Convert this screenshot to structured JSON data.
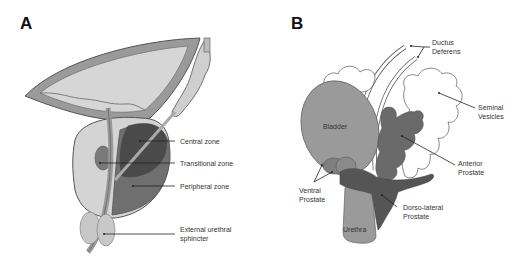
{
  "panel_a": {
    "letter": "A",
    "labels": {
      "central_zone": "Central zone",
      "transitional_zone": "Transitional zone",
      "peripheral_zone": "Peripheral zone",
      "external_sphincter_line1": "External urethral",
      "external_sphincter_line2": "sphincter"
    }
  },
  "panel_b": {
    "letter": "B",
    "labels": {
      "ductus_line1": "Ductus",
      "ductus_line2": "Deferens",
      "seminal_line1": "Seminal",
      "seminal_line2": "Vesicles",
      "bladder": "Bladder",
      "anterior_line1": "Anterior",
      "anterior_line2": "Prostate",
      "ventral_line1": "Ventral",
      "ventral_line2": "Prostate",
      "dorsolateral_line1": "Dorso-lateral",
      "dorsolateral_line2": "Prostate",
      "urethra": "Urethra"
    }
  },
  "colors": {
    "light_gray": "#d8d8d8",
    "mid_gray": "#9a9a9a",
    "dark_gray": "#6a6a6a",
    "darker_gray": "#555555",
    "outline": "#555555"
  }
}
